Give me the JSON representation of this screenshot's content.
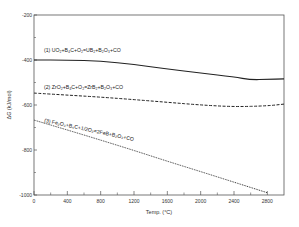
{
  "chart_data": {
    "type": "line",
    "title": "",
    "xlabel": "Temp. (°C)",
    "ylabel": "ΔG (kJ/mol)",
    "xlim": [
      0,
      3000
    ],
    "ylim": [
      -1000,
      -200
    ],
    "x_ticks": [
      0,
      400,
      800,
      1200,
      1600,
      2000,
      2400,
      2800
    ],
    "x_tick_labels": [
      "0",
      "400",
      "800",
      "1200",
      "1600",
      "2000",
      "2400",
      "2800"
    ],
    "y_ticks": [
      -200,
      -400,
      -600,
      -800,
      -1000
    ],
    "y_tick_labels": [
      "-200",
      "-400",
      "-600",
      "-800",
      "-1000"
    ],
    "grid": false,
    "legend": "inline labels",
    "series": [
      {
        "name": "(1) UO2+B4C+O2=UB2+B2O3+CO",
        "style": "solid",
        "x": [
          0,
          400,
          800,
          1200,
          1600,
          2000,
          2400,
          2600,
          2800,
          3000
        ],
        "values": [
          -400,
          -400,
          -405,
          -420,
          -440,
          -458,
          -475,
          -488,
          -486,
          -484
        ]
      },
      {
        "name": "(2) ZrO2+B4C+O2=ZrB2+B2O3+CO",
        "style": "dashed",
        "x": [
          0,
          400,
          800,
          1200,
          1600,
          2000,
          2400,
          2800,
          3000
        ],
        "values": [
          -547,
          -556,
          -565,
          -576,
          -588,
          -600,
          -608,
          -604,
          -596
        ]
      },
      {
        "name": "(3) Fe2O3+B4C+1/2O2=2FeB+B2O3+CO",
        "style": "dotted",
        "x": [
          0,
          400,
          800,
          1200,
          1600,
          2000,
          2400,
          2800
        ],
        "values": [
          -667,
          -711,
          -756,
          -802,
          -850,
          -896,
          -943,
          -990
        ]
      }
    ]
  },
  "labels": {
    "series1": "(1) UO₂+B₄C+O₂=UB₂+B₂O₃+CO",
    "series2": "(2) ZrO₂+B₄C+O₂=ZrB₂+B₂O₃+CO",
    "series3": "(3) Fe₂O₃+B₄C+1/2O₂=2FeB+B₂O₃+CO",
    "xlabel": "Temp. (°C)",
    "ylabel": "ΔG (kJ/mol)"
  }
}
